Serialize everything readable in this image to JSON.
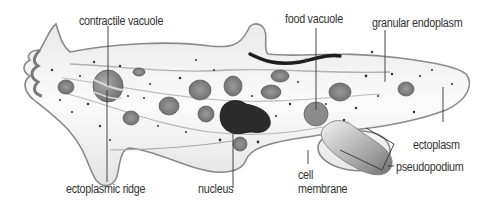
{
  "diagram": {
    "labels": {
      "contractile_vacuole": "contractile vacuole",
      "food_vacuole": "food vacuole",
      "granular_endoplasm": "granular endoplasm",
      "ectoplasm": "ectoplasm",
      "pseudopodium": "pseudopodium",
      "cell_membrane_line1": "cell",
      "cell_membrane_line2": "membrane",
      "nucleus": "nucleus",
      "ectoplasmic_ridge": "ectoplasmic ridge"
    },
    "colors": {
      "background": "#ffffff",
      "membrane": "#9a9a9a",
      "cytoplasm": "#f4f4f4",
      "organelle": "#8a8a8a",
      "nucleus": "#2a2a2a",
      "text": "#333333",
      "leader": "#333333"
    }
  }
}
